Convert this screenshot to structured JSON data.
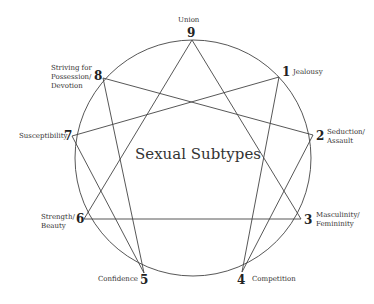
{
  "title": "Sexual Subtypes",
  "colors": {
    "line": "#444444",
    "text": "#333333",
    "background": "#ffffff"
  },
  "circle": {
    "cx": 193,
    "cy": 158,
    "r": 118
  },
  "points": [
    {
      "num": "1",
      "label": "Jealousy",
      "x": 279,
      "y": 77
    },
    {
      "num": "2",
      "label": "Seduction/\nAssault",
      "x": 313,
      "y": 135
    },
    {
      "num": "3",
      "label": "Masculinity/\nFemininity",
      "x": 301,
      "y": 219
    },
    {
      "num": "4",
      "label": "Competition",
      "x": 242,
      "y": 272
    },
    {
      "num": "5",
      "label": "Confidence",
      "x": 144,
      "y": 273
    },
    {
      "num": "6",
      "label": "Strength/\nBeauty",
      "x": 84,
      "y": 219
    },
    {
      "num": "7",
      "label": "Susceptibility",
      "x": 72,
      "y": 136
    },
    {
      "num": "8",
      "label": "Striving for\nPossession/\nDevotion",
      "x": 103,
      "y": 78
    },
    {
      "num": "9",
      "label": "Union",
      "x": 192,
      "y": 40
    }
  ],
  "triangle": [
    "9",
    "3",
    "6"
  ],
  "hexad": [
    "1",
    "4",
    "2",
    "8",
    "5",
    "7"
  ]
}
